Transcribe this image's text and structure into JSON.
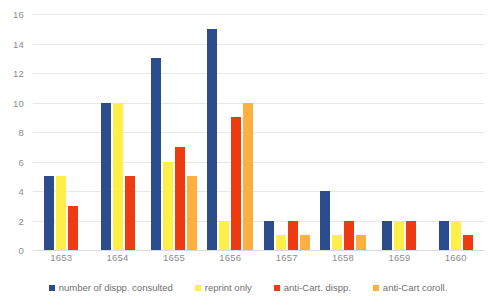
{
  "chart_data": {
    "type": "bar",
    "title": "",
    "subtitle": "",
    "xlabel": "",
    "ylabel": "",
    "categories": [
      "1653",
      "1654",
      "1655",
      "1656",
      "1657",
      "1658",
      "1659",
      "1660"
    ],
    "series": [
      {
        "name": "number of dispp. consulted",
        "color": "#2b4d8e",
        "values": [
          5,
          10,
          13,
          15,
          2,
          4,
          2,
          2
        ]
      },
      {
        "name": "reprint only",
        "color": "#ffef47",
        "values": [
          5,
          10,
          6,
          2,
          1,
          1,
          2,
          2
        ]
      },
      {
        "name": "anti-Cart. dispp.",
        "color": "#ee3b12",
        "values": [
          3,
          5,
          7,
          9,
          2,
          2,
          2,
          1
        ]
      },
      {
        "name": "anti-Cart coroll.",
        "color": "#fbb040",
        "values": [
          0,
          0,
          5,
          10,
          1,
          1,
          0,
          0
        ]
      }
    ],
    "ylim": [
      0,
      16
    ],
    "ytick_step": 2,
    "yticks": [
      "16",
      "14",
      "12",
      "10",
      "8",
      "6",
      "4",
      "2",
      "0"
    ],
    "grid": true,
    "legend_position": "bottom"
  },
  "legend": {
    "items": [
      {
        "label": "number of dispp. consulted"
      },
      {
        "label": "reprint only"
      },
      {
        "label": "anti-Cart. dispp."
      },
      {
        "label": "anti-Cart coroll."
      }
    ]
  }
}
